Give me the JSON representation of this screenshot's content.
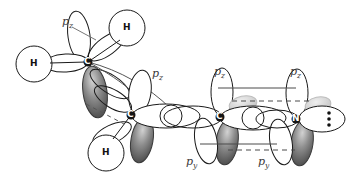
{
  "figure": {
    "background": "#ffffff",
    "stroke": "#1a1a1a",
    "label_color": "#3a3a3a",
    "lobe_dark": "#6b6b6b",
    "lobe_light": "#ffffff",
    "ghost": "#c9c9c9"
  },
  "atoms": [
    {
      "id": "c1",
      "label": "C",
      "x": 88,
      "y": 62,
      "kind": "carbon"
    },
    {
      "id": "c2",
      "label": "C",
      "x": 131,
      "y": 115,
      "kind": "carbon"
    },
    {
      "id": "c3",
      "label": "C",
      "x": 220,
      "y": 117,
      "kind": "carbon"
    },
    {
      "id": "n1",
      "label": "N",
      "x": 296,
      "y": 119,
      "kind": "nitrogen"
    }
  ],
  "hydrogens": [
    {
      "id": "h1",
      "label": "H",
      "x": 34,
      "y": 64
    },
    {
      "id": "h2",
      "label": "H",
      "x": 127,
      "y": 28
    },
    {
      "id": "h3",
      "label": "H",
      "x": 106,
      "y": 153
    }
  ],
  "lone_pair": {
    "label": "dots",
    "x": 327,
    "y": 118,
    "count": 2
  },
  "orbital_labels": [
    {
      "id": "pz-1",
      "text": "p",
      "sub": "z",
      "x": 62,
      "y": 16
    },
    {
      "id": "pz-2",
      "text": "p",
      "sub": "z",
      "x": 152,
      "y": 68
    },
    {
      "id": "pz-3",
      "text": "p",
      "sub": "z",
      "x": 214,
      "y": 66
    },
    {
      "id": "pz-4",
      "text": "p",
      "sub": "z",
      "x": 290,
      "y": 66
    },
    {
      "id": "py-1",
      "text": "p",
      "sub": "y",
      "x": 186,
      "y": 156
    },
    {
      "id": "py-2",
      "text": "p",
      "sub": "y",
      "x": 258,
      "y": 156
    }
  ],
  "overlap_lines": [
    {
      "id": "pz-solid-top",
      "style": "solid",
      "x1": 218,
      "y1": 88,
      "x2": 296,
      "y2": 88
    },
    {
      "id": "pz-dashed-mid",
      "style": "dashed",
      "x1": 232,
      "y1": 101,
      "x2": 310,
      "y2": 101
    },
    {
      "id": "py-solid-bottom",
      "style": "solid",
      "x1": 202,
      "y1": 144,
      "x2": 277,
      "y2": 144
    },
    {
      "id": "py-dashed-bottom",
      "style": "dashed",
      "x1": 228,
      "y1": 150,
      "x2": 293,
      "y2": 150
    },
    {
      "id": "c1c2-dashed",
      "style": "dashed",
      "x1": 86,
      "y1": 104,
      "x2": 124,
      "y2": 124
    }
  ]
}
